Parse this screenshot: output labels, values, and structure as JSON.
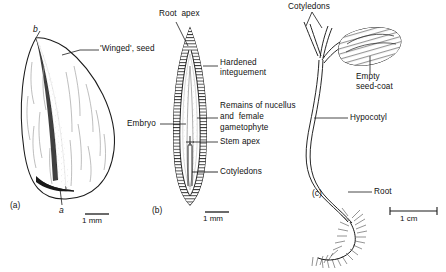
{
  "figure": {
    "background": "#ffffff",
    "ink": "#111111"
  },
  "panels": [
    {
      "id": "a",
      "id_label": "(a)",
      "name": "winged-seed",
      "labels": [
        {
          "key": "winged_seed",
          "text": "'Winged', seed"
        }
      ],
      "markers": [
        {
          "key": "apex_marker",
          "text": "b"
        },
        {
          "key": "base_marker",
          "text": "a"
        }
      ],
      "scale": {
        "text": "1 mm"
      }
    },
    {
      "id": "b",
      "id_label": "(b)",
      "name": "embryo-longitudinal-section",
      "labels": [
        {
          "key": "root_apex",
          "text": "Root  apex"
        },
        {
          "key": "hardened_integument",
          "text": "Hardened\ninteguement"
        },
        {
          "key": "remains_nucellus",
          "text": "Remains of nucellus\nand  female\ngametophyte"
        },
        {
          "key": "stem_apex",
          "text": "Stem apex"
        },
        {
          "key": "cotyledons",
          "text": "Cotyledons"
        },
        {
          "key": "embryo",
          "text": "Embryo"
        }
      ],
      "scale": {
        "text": "1 mm"
      }
    },
    {
      "id": "c",
      "id_label": "(c)",
      "name": "seedling",
      "labels": [
        {
          "key": "cotyledons",
          "text": "Cotyledons"
        },
        {
          "key": "empty_seed_coat",
          "text": "Empty\nseed-coat"
        },
        {
          "key": "hypocotyl",
          "text": "Hypocotyl"
        },
        {
          "key": "root",
          "text": "Root"
        }
      ],
      "scale": {
        "text": "1 cm"
      }
    }
  ],
  "text": {
    "a_id": "(a)",
    "a_winged": "'Winged', seed",
    "a_marker_b": "b",
    "a_marker_a": "a",
    "a_scale": "1 mm",
    "b_id": "(b)",
    "b_root_apex": "Root  apex",
    "b_hardened_1": "Hardened",
    "b_hardened_2": "integuement",
    "b_nucellus_1": "Remains of nucellus",
    "b_nucellus_2": "and  female",
    "b_nucellus_3": "gametophyte",
    "b_stem_apex": "Stem apex",
    "b_cotyledons": "Cotyledons",
    "b_embryo": "Embryo",
    "b_scale": "1 mm",
    "c_id": "(c)",
    "c_cotyledons": "Cotyledons",
    "c_seedcoat_1": "Empty",
    "c_seedcoat_2": "seed-coat",
    "c_hypocotyl": "Hypocotyl",
    "c_root": "Root",
    "c_scale": "1 cm"
  }
}
